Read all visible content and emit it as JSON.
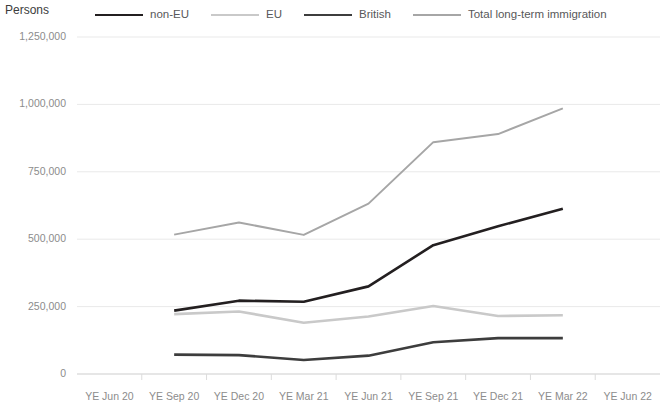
{
  "axis_title": "Persons",
  "legend": {
    "items": [
      {
        "label": "non-EU",
        "color": "#231f20",
        "width": 2.6
      },
      {
        "label": "EU",
        "color": "#c9c9c9",
        "width": 2.6
      },
      {
        "label": "British",
        "color": "#3d3d3d",
        "width": 2.6
      },
      {
        "label": "Total long-term immigration",
        "color": "#a6a6a6",
        "width": 2.0
      }
    ]
  },
  "chart_data": {
    "type": "line",
    "title": "",
    "xlabel": "",
    "ylabel": "Persons",
    "ylim": [
      0,
      1250000
    ],
    "grid": true,
    "legend_position": "top",
    "ytick_labels": [
      "1,250,000",
      "1,000,000",
      "750,000",
      "500,000",
      "250,000",
      "0"
    ],
    "ytick_values": [
      1250000,
      1000000,
      750000,
      500000,
      250000,
      0
    ],
    "categories": [
      "YE Jun 20",
      "YE Sep 20",
      "YE Dec 20",
      "YE Mar 21",
      "YE Jun 21",
      "YE Sep 21",
      "YE Dec 21",
      "YE Mar 22",
      "YE Jun 22"
    ],
    "x_data_categories": [
      "YE Sep 20",
      "YE Dec 20",
      "YE Mar 21",
      "YE Jun 21",
      "YE Sep 21",
      "YE Dec 21",
      "YE Mar 22"
    ],
    "series": [
      {
        "name": "non-EU",
        "color": "#231f20",
        "width": 2.6,
        "values": [
          310000,
          235000,
          272000,
          268000,
          325000,
          478000,
          548000,
          613000,
          695000
        ]
      },
      {
        "name": "EU",
        "color": "#c9c9c9",
        "width": 2.6,
        "values": [
          302000,
          222000,
          232000,
          190000,
          213000,
          252000,
          215000,
          218000,
          218000
        ]
      },
      {
        "name": "British",
        "color": "#3d3d3d",
        "width": 2.6,
        "values": [
          88000,
          72000,
          70000,
          52000,
          68000,
          118000,
          133000,
          133000,
          130000
        ]
      },
      {
        "name": "Total long-term immigration",
        "color": "#a6a6a6",
        "width": 2.0,
        "values": [
          722000,
          517000,
          562000,
          516000,
          632000,
          860000,
          890000,
          985000,
          1055000
        ]
      }
    ]
  }
}
